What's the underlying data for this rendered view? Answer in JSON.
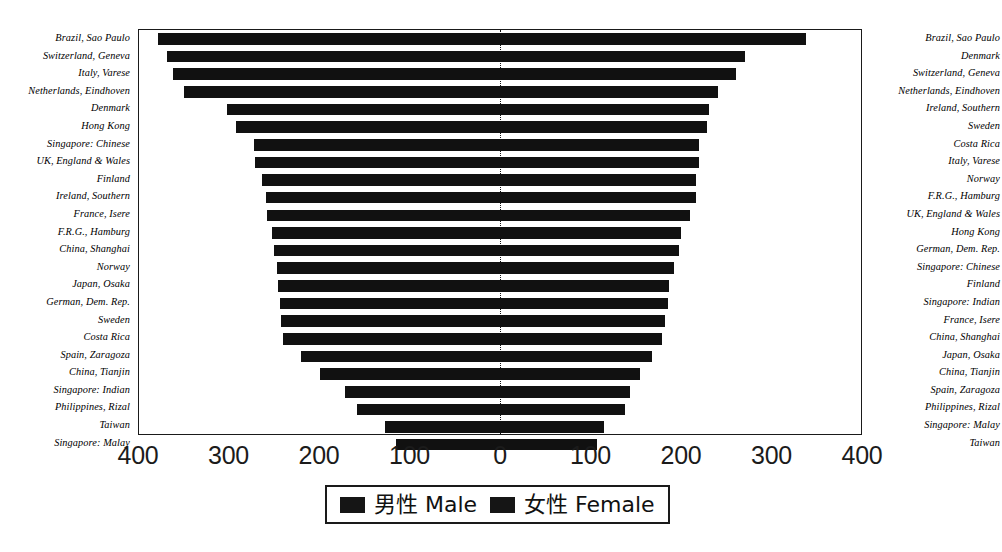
{
  "chart_data": {
    "type": "bar",
    "orientation": "horizontal-diverging",
    "title": "",
    "xlabel": "",
    "ylabel": "",
    "xlim": [
      -400,
      400
    ],
    "grid": false,
    "zero_line": true,
    "legend": {
      "position": "bottom-center",
      "entries": [
        {
          "label": "男性 Male",
          "color": "#151515"
        },
        {
          "label": "女性 Female",
          "color": "#151515"
        }
      ]
    },
    "axis_ticks": [
      {
        "label": "400",
        "value": -400
      },
      {
        "label": "300",
        "value": -300
      },
      {
        "label": "200",
        "value": -200
      },
      {
        "label": "100",
        "value": -100
      },
      {
        "label": "0",
        "value": 0
      },
      {
        "label": "100",
        "value": 100
      },
      {
        "label": "200",
        "value": 200
      },
      {
        "label": "300",
        "value": 300
      },
      {
        "label": "400",
        "value": 400
      }
    ],
    "left_axis_labels": [
      "Brazil, Sao Paulo",
      "Switzerland, Geneva",
      "Italy, Varese",
      "Netherlands, Eindhoven",
      "Denmark",
      "Hong Kong",
      "Singapore: Chinese",
      "UK, England & Wales",
      "Finland",
      "Ireland, Southern",
      "France, Isere",
      "F.R.G., Hamburg",
      "China, Shanghai",
      "Norway",
      "Japan, Osaka",
      "German, Dem. Rep.",
      "Sweden",
      "Costa Rica",
      "Spain, Zaragoza",
      "China, Tianjin",
      "Singapore: Indian",
      "Philippines, Rizal",
      "Taiwan",
      "Singapore: Malay"
    ],
    "right_axis_labels": [
      "Brazil, Sao Paulo",
      "Denmark",
      "Switzerland, Geneva",
      "Netherlands, Eindhoven",
      "Ireland, Southern",
      "Sweden",
      "Costa Rica",
      "Italy, Varese",
      "Norway",
      "F.R.G., Hamburg",
      "UK, England & Wales",
      "Hong Kong",
      "German, Dem. Rep.",
      "Singapore: Chinese",
      "Finland",
      "Singapore: Indian",
      "France, Isere",
      "China, Shanghai",
      "Japan, Osaka",
      "China, Tianjin",
      "Spain, Zaragoza",
      "Philippines, Rizal",
      "Singapore: Malay",
      "Taiwan"
    ],
    "series": [
      {
        "name": "男性 Male",
        "values": [
          379,
          369,
          362,
          350,
          303,
          293,
          273,
          271,
          264,
          259,
          258,
          253,
          250,
          247,
          246,
          244,
          243,
          240,
          221,
          200,
          172,
          158,
          127,
          115
        ]
      },
      {
        "name": "女性 Female",
        "values": [
          339,
          271,
          261,
          241,
          232,
          229,
          221,
          221,
          217,
          217,
          210,
          201,
          198,
          193,
          187,
          186,
          183,
          180,
          168,
          155,
          144,
          139,
          115,
          108
        ]
      }
    ]
  }
}
